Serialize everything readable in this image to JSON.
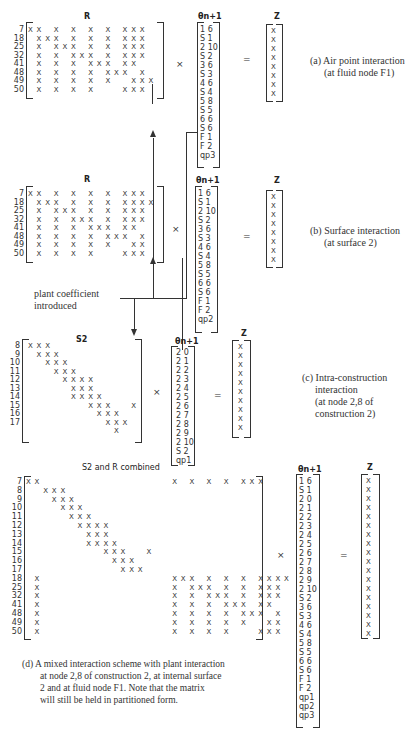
{
  "panels": {
    "a": {
      "matrix_title": "R",
      "row_labels": [
        "7",
        "18",
        "25",
        "32",
        "41",
        "48",
        "49",
        "50"
      ],
      "vector_title": "θn+1",
      "vector": [
        "1 6",
        "S 1",
        "2 10",
        "S 2",
        "3 6",
        "S 3",
        "4 6",
        "S 4",
        "5 8",
        "S 5",
        "6 6",
        "S 6",
        "F 1",
        "F 2",
        "qp3"
      ],
      "result_title": "Z",
      "result": [
        "X",
        "X",
        "X",
        "X",
        "X",
        "X",
        "X",
        "X"
      ],
      "times": "×",
      "equals": "=",
      "caption_line1": "(a) Air point interaction",
      "caption_line2": "(at fluid node F1)"
    },
    "b": {
      "matrix_title": "R",
      "row_labels": [
        "7",
        "18",
        "25",
        "32",
        "41",
        "48",
        "49",
        "50"
      ],
      "vector_title": "θn+1",
      "vector": [
        "1 6",
        "S 1",
        "2 10",
        "S 2",
        "3 6",
        "S 3",
        "4 6",
        "S 4",
        "5 8",
        "S 5",
        "6 6",
        "S 6",
        "F 1",
        "F 2",
        "qp2"
      ],
      "result_title": "Z",
      "result": [
        "X",
        "X",
        "X",
        "X",
        "X",
        "X",
        "X",
        "X"
      ],
      "times": "×",
      "equals": "=",
      "caption_line1": "(b) Surface interaction",
      "caption_line2": "(at surface 2)"
    },
    "annotation": {
      "plant_line1": "plant coefficient",
      "plant_line2": "introduced"
    },
    "c": {
      "matrix_title": "S2",
      "row_labels": [
        "8",
        "9",
        "10",
        "11",
        "12",
        "13",
        "14",
        "15",
        "16",
        "17"
      ],
      "vector_title": "θn+1",
      "vector": [
        "2 0",
        "2 1",
        "2 2",
        "2 3",
        "2 4",
        "2 5",
        "2 6",
        "2 7",
        "2 8",
        "2 9",
        "2 10",
        "S 2",
        "qp1"
      ],
      "result_title": "Z",
      "result": [
        "X",
        "X",
        "X",
        "X",
        "X",
        "X",
        "X",
        "X",
        "X",
        "X"
      ],
      "times": "×",
      "equals": "=",
      "caption_line1": "(c) Intra-construction",
      "caption_line2": "interaction",
      "caption_line3": "(at node 2,8 of",
      "caption_line4": "construction 2)"
    },
    "d": {
      "matrix_title": "S2 and R combined",
      "row_labels": [
        "7",
        "8",
        "9",
        "10",
        "11",
        "12",
        "13",
        "14",
        "15",
        "16",
        "17",
        "18",
        "25",
        "32",
        "41",
        "48",
        "49",
        "50"
      ],
      "vector_title": "θn+1",
      "vector": [
        "1 6",
        "S 1",
        "2 0",
        "2 1",
        "2 2",
        "2 3",
        "2 4",
        "2 5",
        "2 6",
        "2 7",
        "2 8",
        "2 9",
        "2 10",
        "S 2",
        "3 6",
        "S 3",
        "4 6",
        "S 4",
        "5 8",
        "S 5",
        "6 6",
        "S 6",
        "F 1",
        "F 2",
        "qp1",
        "qp2",
        "qp3"
      ],
      "result_title": "Z",
      "result": [
        "X",
        "X",
        "X",
        "X",
        "X",
        "X",
        "X",
        "X",
        "X",
        "X",
        "X",
        "X",
        "X",
        "X",
        "X",
        "X",
        "X",
        "X"
      ],
      "times": "×",
      "equals": "=",
      "caption_line1": "(d) A mixed interaction scheme with plant interaction",
      "caption_line2": "at node 2,8 of construction 2, at internal surface",
      "caption_line3": "2 and at fluid node F1. Note that the matrix",
      "caption_line4": "will still be held in partitioned form."
    }
  },
  "matrix_patterns": {
    "R_a": [
      [
        0,
        1,
        3,
        5,
        7,
        9,
        11,
        12,
        13
      ],
      [
        1,
        2,
        3,
        5,
        7,
        9,
        11,
        12,
        13
      ],
      [
        1,
        3,
        4,
        5,
        7,
        9,
        11,
        12,
        13
      ],
      [
        1,
        3,
        5,
        6,
        7,
        9,
        11,
        12,
        13
      ],
      [
        1,
        3,
        5,
        7,
        8,
        9,
        11,
        12
      ],
      [
        1,
        3,
        5,
        7,
        9,
        10,
        11,
        13
      ],
      [
        1,
        3,
        5,
        7,
        9,
        12,
        13,
        14
      ],
      [
        1,
        3,
        5,
        7,
        11,
        12,
        13
      ]
    ],
    "R_b": [
      [
        0,
        1,
        3,
        5,
        7,
        9,
        11,
        12,
        13
      ],
      [
        1,
        2,
        3,
        5,
        7,
        9,
        11,
        12,
        13,
        14
      ],
      [
        1,
        3,
        4,
        5,
        7,
        9,
        11,
        12,
        13
      ],
      [
        1,
        3,
        5,
        6,
        7,
        9,
        11,
        12,
        13
      ],
      [
        1,
        3,
        5,
        7,
        8,
        9,
        11,
        12
      ],
      [
        1,
        3,
        5,
        7,
        9,
        10,
        11,
        13
      ],
      [
        1,
        3,
        5,
        7,
        9,
        12,
        13
      ],
      [
        1,
        3,
        5,
        7,
        11,
        12,
        13
      ]
    ],
    "S2": [
      [
        0,
        1,
        2
      ],
      [
        1,
        2,
        3
      ],
      [
        2,
        3,
        4
      ],
      [
        3,
        4,
        5
      ],
      [
        4,
        5,
        6,
        7
      ],
      [
        5,
        6,
        7
      ],
      [
        5,
        6,
        7,
        8
      ],
      [
        7,
        8,
        9,
        12
      ],
      [
        8,
        9,
        10
      ],
      [
        9,
        10,
        11
      ],
      [
        10
      ]
    ]
  }
}
